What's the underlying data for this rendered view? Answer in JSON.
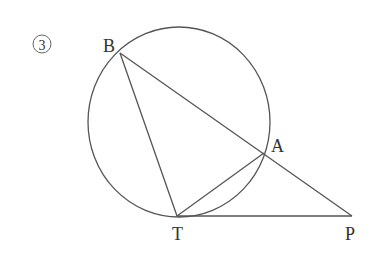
{
  "figure": {
    "number_label": "③",
    "points": {
      "B": {
        "label": "B",
        "x": 120,
        "y": 53
      },
      "A": {
        "label": "A",
        "x": 264,
        "y": 153
      },
      "T": {
        "label": "T",
        "x": 177,
        "y": 216
      },
      "P": {
        "label": "P",
        "x": 352,
        "y": 216
      }
    },
    "circle": {
      "cx": 179,
      "cy": 122,
      "rx": 91,
      "ry": 95
    },
    "segments": [
      "BT",
      "BP",
      "TA",
      "TP"
    ],
    "stroke_color": "#555555"
  }
}
